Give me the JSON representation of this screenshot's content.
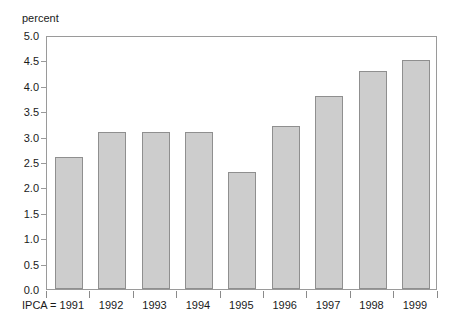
{
  "title_remnant": "",
  "axis": {
    "unit_label": "percent",
    "y_ticks": [
      "5.0",
      "4.5",
      "4.0",
      "3.5",
      "3.0",
      "2.5",
      "2.0",
      "1.5",
      "1.0",
      "0.5",
      "0.0"
    ],
    "x_first_label": "IPCA = 1991"
  },
  "colors": {
    "bar_fill": "#cdcdcd",
    "bar_border": "#8f8f8f",
    "frame": "#9a9a9a",
    "text": "#1a1a1a",
    "background": "#ffffff"
  },
  "chart_data": {
    "type": "bar",
    "title": "",
    "xlabel": "",
    "ylabel": "percent",
    "ylim": [
      0.0,
      5.0
    ],
    "ytick_step": 0.5,
    "grid": false,
    "legend": "none",
    "categories": [
      "1991",
      "1992",
      "1993",
      "1994",
      "1995",
      "1996",
      "1997",
      "1998",
      "1999"
    ],
    "category_labels": [
      "IPCA = 1991",
      "1992",
      "1993",
      "1994",
      "1995",
      "1996",
      "1997",
      "1998",
      "1999"
    ],
    "values": [
      2.6,
      3.1,
      3.1,
      3.1,
      2.3,
      3.2,
      3.8,
      4.3,
      4.5
    ]
  }
}
